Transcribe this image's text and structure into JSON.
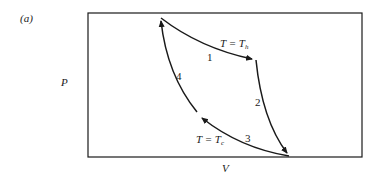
{
  "figure": {
    "panel_label": "(a)",
    "axes": {
      "y_label": "P",
      "x_label": "V"
    },
    "isotherm_hot": {
      "lhs": "T = T",
      "sub": "h"
    },
    "isotherm_cold": {
      "lhs": "T = T",
      "sub": "c"
    },
    "segments": [
      {
        "id": "1",
        "label": "1",
        "type": "isothermal expansion at T_h"
      },
      {
        "id": "2",
        "label": "2",
        "type": "adiabatic expansion"
      },
      {
        "id": "3",
        "label": "3",
        "type": "isothermal compression at T_c"
      },
      {
        "id": "4",
        "label": "4",
        "type": "adiabatic compression"
      }
    ],
    "colors": {
      "line": "#1a1a1a",
      "background": "#ffffff"
    }
  }
}
